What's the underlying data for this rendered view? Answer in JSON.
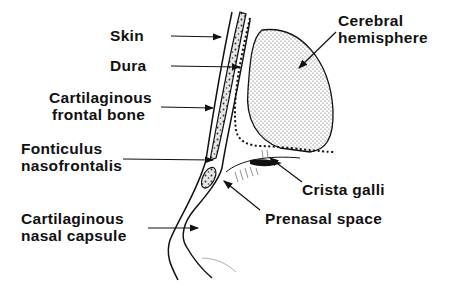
{
  "diagram": {
    "type": "anatomical-sagittal-section",
    "colors": {
      "ink": "#111111",
      "background": "#ffffff",
      "stipple": "#9a9a9a"
    },
    "labels": {
      "skin": [
        "Skin"
      ],
      "dura": [
        "Dura"
      ],
      "cartilaginous_frontal_bone": [
        "Cartilaginous",
        "frontal bone"
      ],
      "fonticulus_nasofrontalis": [
        "Fonticulus",
        "nasofrontalis"
      ],
      "cartilaginous_nasal_capsule": [
        "Cartilaginous",
        "nasal capsule"
      ],
      "cerebral_hemisphere": [
        "Cerebral",
        "hemisphere"
      ],
      "crista_galli": [
        "Crista galli"
      ],
      "prenasal_space": [
        "Prenasal space"
      ]
    }
  }
}
